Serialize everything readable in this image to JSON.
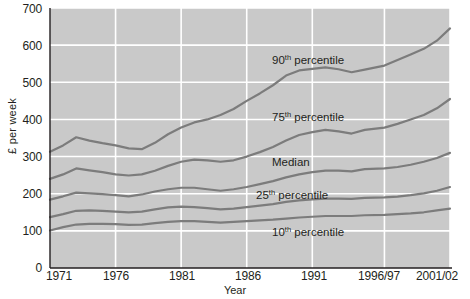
{
  "chart_data": {
    "type": "line",
    "title": "",
    "xlabel": "Year",
    "ylabel": "£ per week",
    "ylim": [
      0,
      700
    ],
    "ytick_values": [
      0,
      100,
      200,
      300,
      400,
      500,
      600,
      700
    ],
    "ytick_labels": [
      "0",
      "100",
      "200",
      "300",
      "400",
      "500",
      "600",
      "700"
    ],
    "xtick_labels": [
      "1971",
      "1976",
      "1981",
      "1986",
      "1991",
      "1996/97",
      "2001/02"
    ],
    "xtick_values": [
      1971,
      1976,
      1981,
      1986,
      1991,
      1996.5,
      2001.5
    ],
    "x": [
      1971,
      1972,
      1973,
      1974,
      1975,
      1976,
      1977,
      1978,
      1979,
      1980,
      1981,
      1982,
      1983,
      1984,
      1985,
      1986,
      1987,
      1988,
      1989,
      1990,
      1991,
      1992,
      1993,
      1994,
      1995,
      1996.5,
      1997.5,
      1998.5,
      1999.5,
      2000.5,
      2001.5
    ],
    "grid": "horizontal-and-vertical",
    "grid_color": "#ffffff",
    "plot_bg": "#c9c9c9",
    "line_color": "#7c7c7c",
    "legend_position": "inline-labels",
    "series": [
      {
        "name": "90th percentile",
        "label": "90ᵗʰ percentile",
        "label_prefix": "90",
        "label_sup": "th",
        "label_suffix": " percentile",
        "values": [
          313,
          330,
          352,
          343,
          336,
          330,
          322,
          320,
          337,
          360,
          378,
          392,
          400,
          412,
          428,
          450,
          470,
          492,
          518,
          532,
          536,
          540,
          535,
          527,
          534,
          545,
          560,
          575,
          590,
          612,
          645
        ]
      },
      {
        "name": "75th percentile",
        "label": "75ᵗʰ percentile",
        "label_prefix": "75",
        "label_sup": "th",
        "label_suffix": " percentile",
        "values": [
          240,
          252,
          268,
          263,
          258,
          252,
          249,
          252,
          262,
          275,
          286,
          292,
          290,
          286,
          290,
          300,
          312,
          326,
          343,
          358,
          366,
          372,
          368,
          362,
          372,
          378,
          388,
          400,
          412,
          430,
          455
        ]
      },
      {
        "name": "Median",
        "label": "Median",
        "label_prefix": "Median",
        "label_sup": "",
        "label_suffix": "",
        "values": [
          184,
          193,
          203,
          201,
          199,
          196,
          193,
          198,
          206,
          212,
          216,
          216,
          212,
          208,
          212,
          218,
          226,
          234,
          244,
          252,
          258,
          262,
          262,
          260,
          266,
          268,
          272,
          278,
          286,
          296,
          310
        ]
      },
      {
        "name": "25th percentile",
        "label": "25ᵗʰ percentile",
        "label_prefix": "25",
        "label_sup": "th",
        "label_suffix": " percentile",
        "values": [
          137,
          145,
          154,
          155,
          154,
          152,
          150,
          152,
          158,
          163,
          165,
          164,
          161,
          158,
          160,
          164,
          168,
          172,
          178,
          182,
          185,
          187,
          187,
          186,
          189,
          190,
          192,
          196,
          201,
          208,
          218
        ]
      },
      {
        "name": "10th percentile",
        "label": "10ᵗʰ percentile",
        "label_prefix": "10",
        "label_sup": "th",
        "label_suffix": " percentile",
        "values": [
          101,
          110,
          117,
          119,
          119,
          118,
          116,
          117,
          121,
          124,
          126,
          126,
          124,
          122,
          124,
          126,
          128,
          130,
          133,
          136,
          138,
          140,
          140,
          140,
          142,
          143,
          145,
          147,
          150,
          155,
          160
        ]
      }
    ],
    "annotations": [
      {
        "text": "90th percentile",
        "x_px": 272,
        "y_px": 64
      },
      {
        "text": "75th percentile",
        "x_px": 272,
        "y_px": 121
      },
      {
        "text": "Median",
        "x_px": 272,
        "y_px": 166
      },
      {
        "text": "25th percentile",
        "x_px": 256,
        "y_px": 199
      },
      {
        "text": "10th percentile",
        "x_px": 272,
        "y_px": 236
      }
    ]
  }
}
